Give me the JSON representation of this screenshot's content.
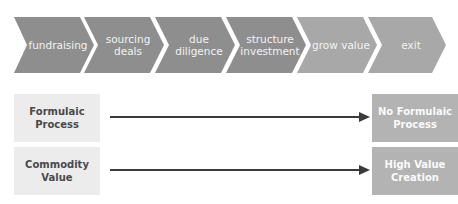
{
  "process_flow": {
    "steps": [
      {
        "label": "fundraising",
        "color": "#8e8e8e"
      },
      {
        "label": "sourcing\ndeals",
        "color": "#8e8e8e"
      },
      {
        "label": "due\ndiligence",
        "color": "#8e8e8e"
      },
      {
        "label": "structure\ninvestment",
        "color": "#8e8e8e"
      },
      {
        "label": "grow value",
        "color": "#a8a8a8"
      },
      {
        "label": "exit",
        "color": "#a8a8a8"
      }
    ]
  },
  "comparisons": [
    {
      "from": "Formulaic\nProcess",
      "to": "No Formulaic\nProcess"
    },
    {
      "from": "Commodity\nValue",
      "to": "High Value\nCreation"
    }
  ],
  "colors": {
    "dark_chevron": "#8e8e8e",
    "light_chevron": "#a8a8a8",
    "left_box": "#ececec",
    "right_box": "#b3b3b3",
    "arrow": "#3a3a3a"
  }
}
